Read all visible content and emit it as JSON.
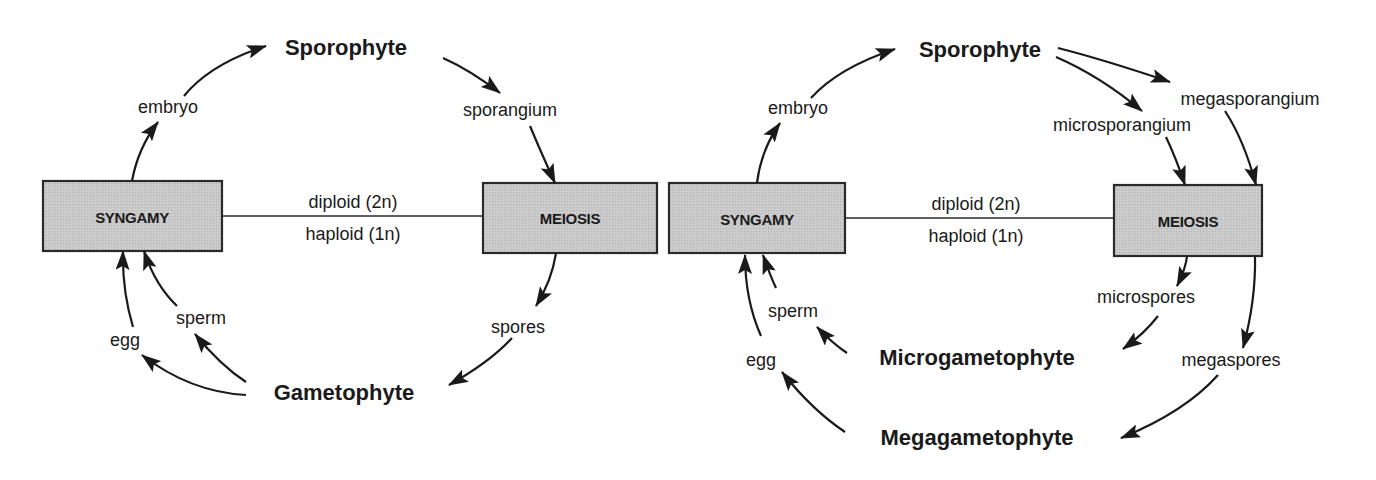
{
  "diagrams": [
    {
      "id": "homosporous",
      "sporophyte": "Sporophyte",
      "gametophyte": "Gametophyte",
      "syngamy": "SYNGAMY",
      "meiosis": "MEIOSIS",
      "diploid": "diploid (2n)",
      "haploid": "haploid (1n)",
      "embryo": "embryo",
      "sporangium": "sporangium",
      "spores": "spores",
      "sperm": "sperm",
      "egg": "egg"
    },
    {
      "id": "heterosporous",
      "sporophyte": "Sporophyte",
      "microgametophyte": "Microgametophyte",
      "megagametophyte": "Megagametophyte",
      "syngamy": "SYNGAMY",
      "meiosis": "MEIOSIS",
      "diploid": "diploid (2n)",
      "haploid": "haploid (1n)",
      "embryo": "embryo",
      "microsporangium": "microsporangium",
      "megasporangium": "megasporangium",
      "microspores": "microspores",
      "megaspores": "megaspores",
      "sperm": "sperm",
      "egg": "egg"
    }
  ],
  "colors": {
    "box_fill": "#c8c8c8",
    "stroke": "#1a1a1a",
    "text": "#1a1a1a",
    "background": "#ffffff"
  }
}
